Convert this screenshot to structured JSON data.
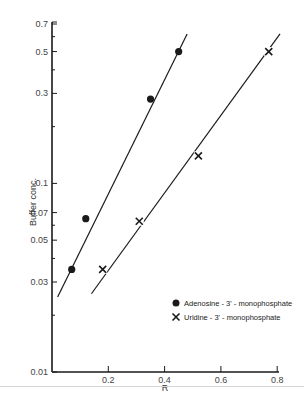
{
  "chart_data": {
    "type": "scatter",
    "title": "",
    "xlabel": "R",
    "ylabel": "Buffer conc.",
    "xscale": "linear",
    "yscale": "log",
    "xlim": [
      0,
      0.82
    ],
    "ylim": [
      0.01,
      0.7
    ],
    "x_ticks": [
      0.2,
      0.4,
      0.6,
      0.8
    ],
    "x_tick_labels": [
      "0.2",
      "0.4",
      "0.6",
      "0.8"
    ],
    "y_ticks": [
      0.01,
      0.03,
      0.05,
      0.07,
      0.1,
      0.3,
      0.5,
      0.7
    ],
    "y_tick_labels": [
      "0.01",
      "0.03",
      "0.05",
      "0.07",
      "0.1",
      "0.3",
      "0.5",
      "0.7"
    ],
    "grid": false,
    "legend_position": "lower right",
    "series": [
      {
        "name": "Adenosine - 3' - monophosphate",
        "marker": "filled-circle",
        "points": [
          {
            "x": 0.07,
            "y": 0.035
          },
          {
            "x": 0.12,
            "y": 0.065
          },
          {
            "x": 0.35,
            "y": 0.28
          },
          {
            "x": 0.45,
            "y": 0.5
          }
        ],
        "fit_line": {
          "x_start": 0.02,
          "y_start": 0.025,
          "x_end": 0.48,
          "y_end": 0.62
        }
      },
      {
        "name": "Uridine - 3' - monophosphate",
        "marker": "cross",
        "points": [
          {
            "x": 0.18,
            "y": 0.035
          },
          {
            "x": 0.31,
            "y": 0.063
          },
          {
            "x": 0.52,
            "y": 0.14
          },
          {
            "x": 0.77,
            "y": 0.5
          }
        ],
        "fit_line": {
          "x_start": 0.14,
          "y_start": 0.026,
          "x_end": 0.81,
          "y_end": 0.62
        }
      }
    ]
  },
  "legend": {
    "items": [
      {
        "label": "Adenosine - 3' - monophosphate",
        "icon": "filled-circle-icon"
      },
      {
        "label": "Uridine - 3' - monophosphate",
        "icon": "cross-icon"
      }
    ]
  },
  "axes": {
    "x_title": "R",
    "y_title": "Buffer conc."
  },
  "colors": {
    "ink": "#1a1a1a",
    "background": "#ffffff"
  }
}
